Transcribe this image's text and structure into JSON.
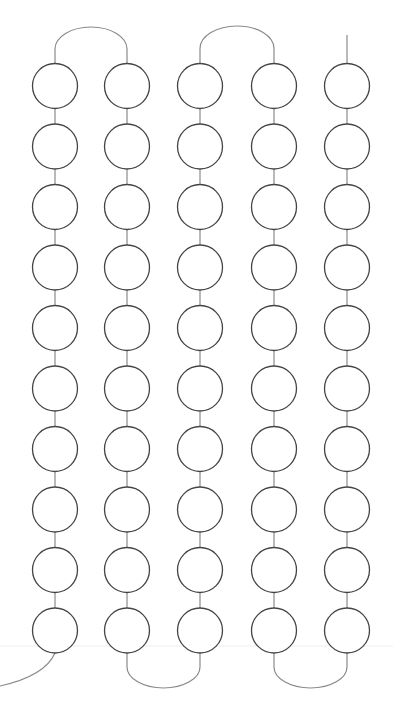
{
  "diagram": {
    "width": 393,
    "height": 714,
    "columns_x": [
      55,
      127,
      200,
      274,
      347
    ],
    "rows": 10,
    "row_first_y": 86,
    "row_step": 60.5,
    "radius": 22.5,
    "colors": {
      "circle_stroke": "#444444",
      "connector_stroke": "#8a8a8a",
      "guide_line": "#eeeeee",
      "background": "#ffffff"
    },
    "top_arcs": [
      {
        "from_col": 0,
        "to_col": 1,
        "peak_y": 27
      },
      {
        "from_col": 2,
        "to_col": 3,
        "peak_y": 26
      }
    ],
    "top_stub": {
      "col": 4,
      "top_y": 35
    },
    "bottom_arcs": [
      {
        "from_col": 1,
        "to_col": 2,
        "bottom_y": 688
      },
      {
        "from_col": 3,
        "to_col": 4,
        "bottom_y": 688
      }
    ],
    "bottom_tail": {
      "col": 0,
      "end_x": 0,
      "end_y": 686
    },
    "guide_line_y": 646
  }
}
